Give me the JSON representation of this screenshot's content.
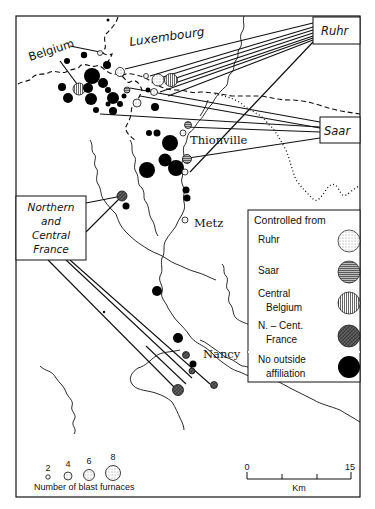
{
  "map": {
    "title": "Blast furnaces in Lorraine-Luxembourg by controlling region",
    "region_labels": {
      "belgium": "Belgium",
      "luxembourg": "Luxembourg"
    },
    "source_boxes": {
      "ruhr": "Ruhr",
      "saar": "Saar",
      "northern_central_france": [
        "Northern",
        "and",
        "Central",
        "France"
      ]
    },
    "towns": {
      "thionville": "Thionville",
      "metz": "Metz",
      "nancy": "Nancy"
    },
    "legend_control": {
      "title": "Controlled from",
      "items": [
        {
          "label": [
            "Ruhr"
          ],
          "pattern": "stippled"
        },
        {
          "label": [
            "Saar"
          ],
          "pattern": "horizontal-hatch"
        },
        {
          "label": [
            "Central",
            "Belgium"
          ],
          "pattern": "vertical-hatch"
        },
        {
          "label": [
            "N. – Cent.",
            "France"
          ],
          "pattern": "diagonal-crosshatch"
        },
        {
          "label": [
            "No outside",
            "affiliation"
          ],
          "pattern": "solid-black"
        }
      ]
    },
    "legend_size": {
      "title": "Number of blast furnaces",
      "sizes": [
        "2",
        "4",
        "6",
        "8"
      ]
    },
    "scale_bar": {
      "unit": "Km",
      "start": "0",
      "end": "15"
    },
    "colors": {
      "ink": "#111111",
      "paper": "#ffffff",
      "saar_fill": "#9a9a9a",
      "france_fill": "#555555"
    }
  }
}
